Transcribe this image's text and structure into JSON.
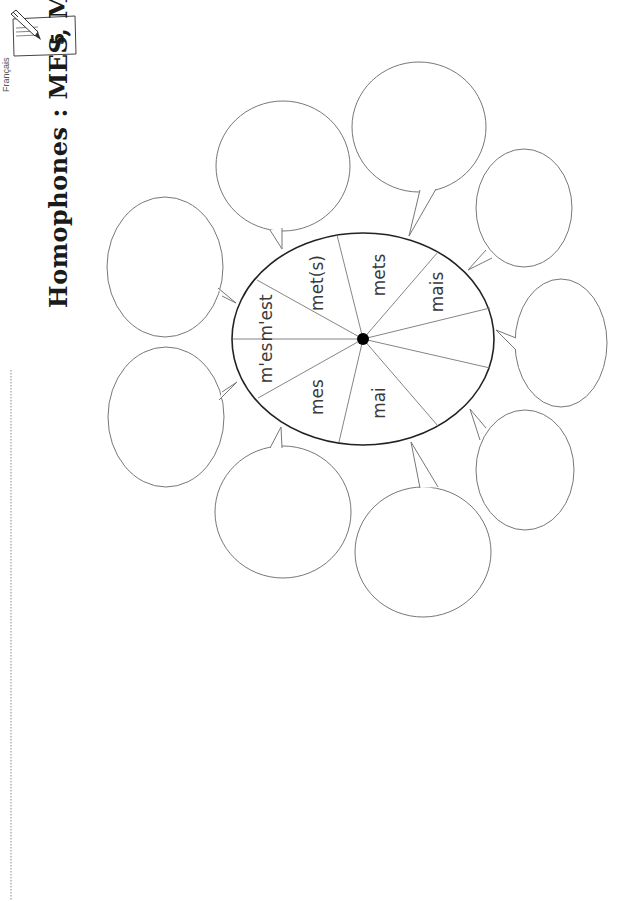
{
  "header": {
    "subject": "Français",
    "badge_number": "5",
    "badge_icon": "pen-icon",
    "title": "Homophones : MES, MAIS..."
  },
  "wheel": {
    "words": [
      "m'est",
      "met(s)",
      "mets",
      "mais",
      "mai",
      "mes",
      "m'es"
    ],
    "blank_segments": 2
  },
  "bubbles": {
    "count": 9,
    "content": "empty"
  },
  "name_line": "dotted line"
}
